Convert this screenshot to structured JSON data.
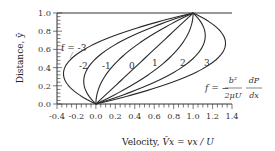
{
  "chart_data": {
    "type": "line",
    "title": "",
    "xlabel": "Velocity, V̄x = vx / U",
    "ylabel": "Distance, ȳ",
    "xlim": [
      -0.4,
      1.4
    ],
    "ylim": [
      0.0,
      1.0
    ],
    "x_ticks": [
      "-0.4",
      "-0.2",
      "0.0",
      "0.2",
      "0.4",
      "0.6",
      "0.8",
      "1.0",
      "1.2",
      "1.4"
    ],
    "y_ticks": [
      "0.0",
      "0.2",
      "0.4",
      "0.6",
      "0.8",
      "1.0"
    ],
    "grid": false,
    "legend": "none (inline curve labels)",
    "model": "V = y + f·y·(1−y)",
    "series": [
      {
        "name": "f = -3",
        "f": -3,
        "y": [
          0,
          0.1,
          0.2,
          0.3,
          0.333,
          0.4,
          0.5,
          0.6,
          0.7,
          0.8,
          0.9,
          1.0
        ],
        "x": [
          0,
          -0.17,
          -0.28,
          -0.33,
          -0.333,
          -0.32,
          -0.25,
          -0.12,
          0.07,
          0.32,
          0.63,
          1.0
        ]
      },
      {
        "name": "-2",
        "f": -2,
        "y": [
          0,
          0.1,
          0.2,
          0.3,
          0.4,
          0.5,
          0.6,
          0.7,
          0.8,
          0.9,
          1.0
        ],
        "x": [
          0,
          -0.08,
          -0.12,
          -0.12,
          -0.08,
          0.0,
          0.12,
          0.28,
          0.48,
          0.72,
          1.0
        ]
      },
      {
        "name": "-1",
        "f": -1,
        "y": [
          0,
          0.1,
          0.2,
          0.3,
          0.4,
          0.5,
          0.6,
          0.7,
          0.8,
          0.9,
          1.0
        ],
        "x": [
          0,
          0.01,
          0.04,
          0.09,
          0.16,
          0.25,
          0.36,
          0.49,
          0.64,
          0.81,
          1.0
        ]
      },
      {
        "name": "0",
        "f": 0,
        "y": [
          0,
          0.2,
          0.4,
          0.6,
          0.8,
          1.0
        ],
        "x": [
          0,
          0.2,
          0.4,
          0.6,
          0.8,
          1.0
        ]
      },
      {
        "name": "1",
        "f": 1,
        "y": [
          0,
          0.1,
          0.2,
          0.3,
          0.4,
          0.5,
          0.6,
          0.7,
          0.8,
          0.9,
          1.0
        ],
        "x": [
          0,
          0.19,
          0.36,
          0.51,
          0.64,
          0.75,
          0.84,
          0.91,
          0.96,
          0.99,
          1.0
        ]
      },
      {
        "name": "2",
        "f": 2,
        "y": [
          0,
          0.1,
          0.2,
          0.3,
          0.4,
          0.5,
          0.6,
          0.7,
          0.8,
          0.9,
          1.0
        ],
        "x": [
          0,
          0.28,
          0.52,
          0.72,
          0.88,
          1.0,
          1.08,
          1.12,
          1.12,
          1.08,
          1.0
        ]
      },
      {
        "name": "3",
        "f": 3,
        "y": [
          0,
          0.1,
          0.2,
          0.3,
          0.4,
          0.5,
          0.6,
          0.667,
          0.7,
          0.8,
          0.9,
          1.0
        ],
        "x": [
          0,
          0.37,
          0.68,
          0.93,
          1.12,
          1.25,
          1.32,
          1.333,
          1.33,
          1.28,
          1.17,
          1.0
        ]
      }
    ],
    "annotations": {
      "curve_label_first": "f = -3",
      "curve_labels": [
        "-2",
        "-1",
        "0",
        "1",
        "2",
        "3"
      ],
      "formula_lhs": "f = −",
      "formula_num1": "b²",
      "formula_den1": "2μU",
      "formula_num2": "dP",
      "formula_den2": "dx"
    }
  },
  "axes": {
    "y_title": "Distance, ȳ",
    "x_title_prefix": "Velocity, ",
    "x_title_symbol": "V̄x",
    "x_title_rest": " =  vx / U"
  }
}
